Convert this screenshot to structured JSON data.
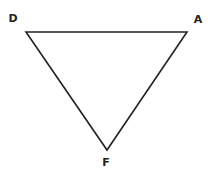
{
  "diagram": {
    "shape": "triangle",
    "stroke_color": "#222222",
    "vertices": [
      {
        "label": "D",
        "x": 26,
        "y": 32,
        "label_x": 13,
        "label_y": 22
      },
      {
        "label": "A",
        "x": 187,
        "y": 32,
        "label_x": 198,
        "label_y": 23
      },
      {
        "label": "F",
        "x": 107,
        "y": 150,
        "label_x": 106,
        "label_y": 166
      }
    ]
  }
}
